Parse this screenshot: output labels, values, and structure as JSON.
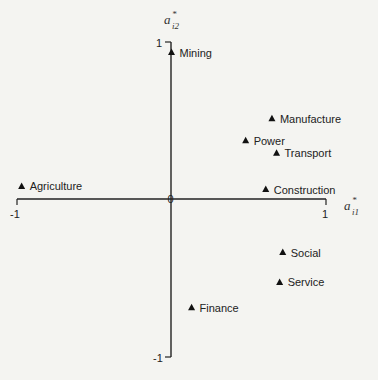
{
  "chart_data": {
    "type": "scatter",
    "title": "",
    "xlabel": "a*_i1",
    "ylabel": "a*_i2",
    "xlim": [
      -1,
      1
    ],
    "ylim": [
      -1,
      1
    ],
    "grid": false,
    "marker": "triangle",
    "x_ticks": [
      "-1",
      "1"
    ],
    "y_ticks": [
      "1",
      "-1"
    ],
    "origin_label": "0",
    "points": [
      {
        "label": "Mining",
        "x": 0.0,
        "y": 0.93
      },
      {
        "label": "Manufacture",
        "x": 0.65,
        "y": 0.51
      },
      {
        "label": "Power",
        "x": 0.48,
        "y": 0.37
      },
      {
        "label": "Transport",
        "x": 0.68,
        "y": 0.29
      },
      {
        "label": "Agriculture",
        "x": -0.97,
        "y": 0.08
      },
      {
        "label": "Construction",
        "x": 0.61,
        "y": 0.06
      },
      {
        "label": "Social",
        "x": 0.72,
        "y": -0.34
      },
      {
        "label": "Service",
        "x": 0.7,
        "y": -0.53
      },
      {
        "label": "Finance",
        "x": 0.13,
        "y": -0.69
      }
    ]
  },
  "axes": {
    "x_label_main": "a",
    "x_label_sup": "*",
    "x_label_sub": "i1",
    "y_label_main": "a",
    "y_label_sup": "*",
    "y_label_sub": "i2",
    "x_min_tick": "-1",
    "x_max_tick": "1",
    "y_max_tick": "1",
    "y_min_tick": "-1",
    "origin": "0"
  }
}
